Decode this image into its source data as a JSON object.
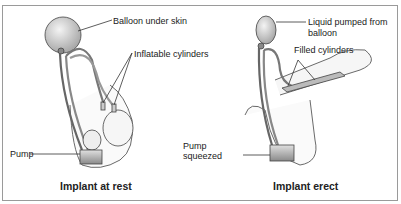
{
  "panels": [
    {
      "caption": "Implant at rest",
      "labels": {
        "balloon": "Balloon under skin",
        "cylinders": "Inflatable cylinders",
        "pump": "Pump"
      }
    },
    {
      "caption": "Implant erect",
      "labels": {
        "liquid_line1": "Liquid pumped from",
        "liquid_line2": "balloon",
        "cylinders": "Filled cylinders",
        "pump_line1": "Pump",
        "pump_line2": "squeezed"
      }
    }
  ],
  "colors": {
    "border": "#9a9a9a",
    "line": "#333333",
    "text": "#222222"
  }
}
